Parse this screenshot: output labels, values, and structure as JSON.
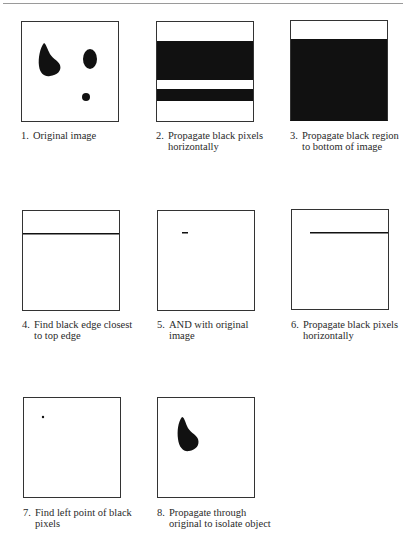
{
  "figure": {
    "steps": [
      {
        "number": "1.",
        "caption": "Original image"
      },
      {
        "number": "2.",
        "caption": "Propagate black pixels horizontally"
      },
      {
        "number": "3.",
        "caption": "Propagate black region to bottom of image"
      },
      {
        "number": "4.",
        "caption": "Find black edge closest to top edge"
      },
      {
        "number": "5.",
        "caption": "AND with original image"
      },
      {
        "number": "6.",
        "caption": "Propagate black pixels horizontally"
      },
      {
        "number": "7.",
        "caption": "Find left point of black pixels"
      },
      {
        "number": "8.",
        "caption": "Propagate through original to isolate object"
      }
    ],
    "colors": {
      "ink": "#111111",
      "frame": "#333333",
      "rule": "#9a9a9a"
    }
  }
}
